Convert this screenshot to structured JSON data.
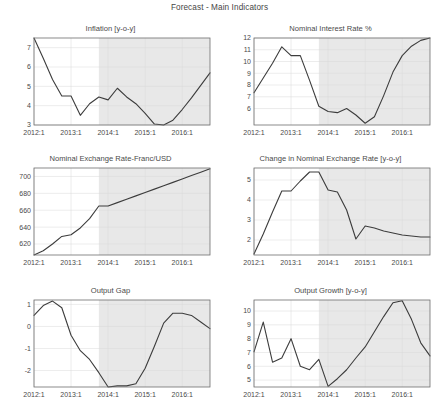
{
  "figure": {
    "title": "Forecast - Main Indicators",
    "background": "#ffffff",
    "line_color": "#3c3c3c",
    "forecast_shade_color": "#e8e8e8",
    "grid_color": "#d9d9d9",
    "axis_color": "#6e6e6e"
  },
  "chart_data": [
    {
      "type": "line",
      "title": "Inflation [y-o-y]",
      "xlabel": "",
      "ylabel": "",
      "grid": true,
      "legend": "none",
      "xlim": [
        2012.0,
        2016.75
      ],
      "ylim": [
        3.0,
        7.5
      ],
      "xticks": [
        2012.0,
        2013.0,
        2014.0,
        2015.0,
        2016.0
      ],
      "xticklabels": [
        "2012:1",
        "2013:1",
        "2014:1",
        "2015:1",
        "2016:1"
      ],
      "yticks": [
        3,
        4,
        5,
        6,
        7
      ],
      "yticklabels": [
        "3",
        "4",
        "5",
        "6",
        "7"
      ],
      "forecast_start": 2013.75,
      "x": [
        2012.0,
        2012.25,
        2012.5,
        2012.75,
        2013.0,
        2013.25,
        2013.5,
        2013.75,
        2014.0,
        2014.25,
        2014.5,
        2014.75,
        2015.0,
        2015.25,
        2015.5,
        2015.75,
        2016.0,
        2016.25,
        2016.5,
        2016.75
      ],
      "y": [
        7.5,
        6.45,
        5.35,
        4.5,
        4.5,
        3.5,
        4.1,
        4.45,
        4.3,
        4.9,
        4.45,
        4.1,
        3.6,
        3.05,
        3.0,
        3.25,
        3.8,
        4.4,
        5.05,
        5.7
      ]
    },
    {
      "type": "line",
      "title": "Nominal Interest Rate %",
      "xlabel": "",
      "ylabel": "",
      "grid": true,
      "legend": "none",
      "xlim": [
        2012.0,
        2016.75
      ],
      "ylim": [
        4.6,
        12.0
      ],
      "xticks": [
        2012.0,
        2013.0,
        2014.0,
        2015.0,
        2016.0
      ],
      "xticklabels": [
        "2012:1",
        "2013:1",
        "2014:1",
        "2015:1",
        "2016:1"
      ],
      "yticks": [
        6,
        7,
        8,
        9,
        10,
        11,
        12
      ],
      "yticklabels": [
        "6",
        "7",
        "8",
        "9",
        "10",
        "11",
        "12"
      ],
      "forecast_start": 2013.75,
      "x": [
        2012.0,
        2012.25,
        2012.5,
        2012.75,
        2013.0,
        2013.25,
        2013.5,
        2013.75,
        2014.0,
        2014.25,
        2014.5,
        2014.75,
        2015.0,
        2015.25,
        2015.5,
        2015.75,
        2016.0,
        2016.25,
        2016.5,
        2016.75
      ],
      "y": [
        7.35,
        8.6,
        9.85,
        11.25,
        10.5,
        10.5,
        8.4,
        6.2,
        5.75,
        5.65,
        6.0,
        5.45,
        4.75,
        5.3,
        7.1,
        9.1,
        10.5,
        11.3,
        11.8,
        12.0
      ]
    },
    {
      "type": "line",
      "title": "Nominal Exchange Rate-Franc/USD",
      "xlabel": "",
      "ylabel": "",
      "grid": true,
      "legend": "none",
      "xlim": [
        2012.0,
        2016.75
      ],
      "ylim": [
        607,
        710
      ],
      "xticks": [
        2012.0,
        2013.0,
        2014.0,
        2015.0,
        2016.0
      ],
      "xticklabels": [
        "2012:1",
        "2013:1",
        "2014:1",
        "2015:1",
        "2016:1"
      ],
      "yticks": [
        620,
        640,
        660,
        680,
        700
      ],
      "yticklabels": [
        "620",
        "640",
        "660",
        "680",
        "700"
      ],
      "forecast_start": 2013.75,
      "x": [
        2012.0,
        2012.25,
        2012.5,
        2012.75,
        2013.0,
        2013.25,
        2013.5,
        2013.75,
        2014.0,
        2014.25,
        2014.5,
        2014.75,
        2015.0,
        2015.25,
        2015.5,
        2015.75,
        2016.0,
        2016.25,
        2016.5,
        2016.75
      ],
      "y": [
        607,
        612,
        620,
        629,
        631,
        639,
        650,
        665,
        665,
        669,
        673,
        677,
        681,
        685,
        689,
        693,
        697,
        701,
        705,
        709
      ]
    },
    {
      "type": "line",
      "title": "Change in Nominal Exchange Rate [y-o-y]",
      "xlabel": "",
      "ylabel": "",
      "grid": true,
      "legend": "none",
      "xlim": [
        2012.0,
        2016.75
      ],
      "ylim": [
        1.25,
        5.6
      ],
      "xticks": [
        2012.0,
        2013.0,
        2014.0,
        2015.0,
        2016.0
      ],
      "xticklabels": [
        "2012:1",
        "2013:1",
        "2014:1",
        "2015:1",
        "2016:1"
      ],
      "yticks": [
        2,
        3,
        4,
        5
      ],
      "yticklabels": [
        "2",
        "3",
        "4",
        "5"
      ],
      "forecast_start": 2013.75,
      "x": [
        2012.0,
        2012.25,
        2012.5,
        2012.75,
        2013.0,
        2013.25,
        2013.5,
        2013.75,
        2014.0,
        2014.25,
        2014.5,
        2014.75,
        2015.0,
        2015.25,
        2015.5,
        2015.75,
        2016.0,
        2016.25,
        2016.5,
        2016.75
      ],
      "y": [
        1.3,
        2.3,
        3.4,
        4.45,
        4.45,
        4.95,
        5.4,
        5.4,
        4.5,
        4.4,
        3.5,
        2.05,
        2.7,
        2.6,
        2.45,
        2.35,
        2.25,
        2.2,
        2.15,
        2.15
      ]
    },
    {
      "type": "line",
      "title": "Output Gap",
      "xlabel": "",
      "ylabel": "",
      "grid": true,
      "legend": "none",
      "xlim": [
        2012.0,
        2016.75
      ],
      "ylim": [
        -2.75,
        1.2
      ],
      "xticks": [
        2012.0,
        2013.0,
        2014.0,
        2015.0,
        2016.0
      ],
      "xticklabels": [
        "2012:1",
        "2013:1",
        "2014:1",
        "2015:1",
        "2016:1"
      ],
      "yticks": [
        -2,
        -1,
        0,
        1
      ],
      "yticklabels": [
        "-2",
        "-1",
        "0",
        "1"
      ],
      "forecast_start": 2013.75,
      "x": [
        2012.0,
        2012.25,
        2012.5,
        2012.75,
        2013.0,
        2013.25,
        2013.5,
        2013.75,
        2014.0,
        2014.25,
        2014.5,
        2014.75,
        2015.0,
        2015.25,
        2015.5,
        2015.75,
        2016.0,
        2016.25,
        2016.5,
        2016.75
      ],
      "y": [
        0.5,
        0.95,
        1.15,
        0.85,
        -0.4,
        -1.1,
        -1.5,
        -2.1,
        -2.75,
        -2.7,
        -2.7,
        -2.6,
        -1.9,
        -0.9,
        0.15,
        0.6,
        0.6,
        0.5,
        0.2,
        -0.1
      ]
    },
    {
      "type": "line",
      "title": "Output Growth [y-o-y]",
      "xlabel": "",
      "ylabel": "",
      "grid": true,
      "legend": "none",
      "xlim": [
        2012.0,
        2016.75
      ],
      "ylim": [
        4.5,
        10.8
      ],
      "xticks": [
        2012.0,
        2013.0,
        2014.0,
        2015.0,
        2016.0
      ],
      "xticklabels": [
        "2012:1",
        "2013:1",
        "2014:1",
        "2015:1",
        "2016:1"
      ],
      "yticks": [
        5,
        6,
        7,
        8,
        9,
        10
      ],
      "yticklabels": [
        "5",
        "6",
        "7",
        "8",
        "9",
        "10"
      ],
      "forecast_start": 2013.75,
      "x": [
        2012.0,
        2012.25,
        2012.5,
        2012.75,
        2013.0,
        2013.25,
        2013.5,
        2013.75,
        2014.0,
        2014.25,
        2014.5,
        2014.75,
        2015.0,
        2015.25,
        2015.5,
        2015.75,
        2016.0,
        2016.25,
        2016.5,
        2016.75
      ],
      "y": [
        7.05,
        9.2,
        6.3,
        6.6,
        8.0,
        6.0,
        5.75,
        6.5,
        4.55,
        5.1,
        5.75,
        6.6,
        7.4,
        8.5,
        9.6,
        10.6,
        10.75,
        9.4,
        7.7,
        6.75
      ]
    }
  ]
}
